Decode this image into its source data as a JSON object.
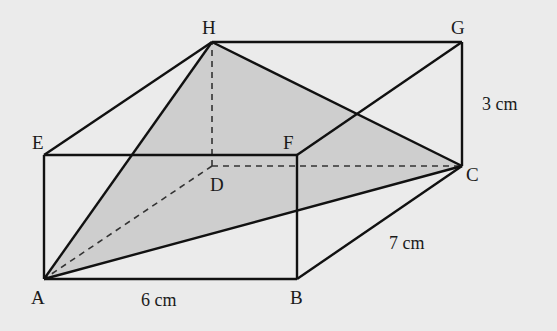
{
  "figure": {
    "background": "#ebebeb",
    "shade_color": "#c9c9c9",
    "line_color": "#111111"
  },
  "vertices": {
    "A": {
      "label": "A",
      "x": 44,
      "y": 279
    },
    "B": {
      "label": "B",
      "x": 297,
      "y": 279
    },
    "C": {
      "label": "C",
      "x": 462,
      "y": 166
    },
    "D": {
      "label": "D",
      "x": 212,
      "y": 166
    },
    "E": {
      "label": "E",
      "x": 44,
      "y": 155
    },
    "F": {
      "label": "F",
      "x": 297,
      "y": 155
    },
    "G": {
      "label": "G",
      "x": 462,
      "y": 42
    },
    "H": {
      "label": "H",
      "x": 212,
      "y": 42
    }
  },
  "dimensions": {
    "AB": "6 cm",
    "BC": "7 cm",
    "CG": "3 cm"
  },
  "shaded_triangle": [
    "A",
    "C",
    "H"
  ],
  "solid_edges": [
    "AB",
    "BC",
    "CG",
    "GH",
    "HE",
    "EA",
    "EF",
    "FB",
    "FG",
    "AH",
    "AC",
    "HC"
  ],
  "hidden_edges": [
    "DA",
    "DC",
    "DH"
  ]
}
